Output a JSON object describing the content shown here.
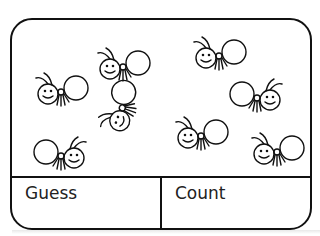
{
  "card": {
    "labels": {
      "guess": "Guess",
      "count": "Count"
    },
    "ants": [
      {
        "x": 22,
        "y": 50,
        "flip": false,
        "rot": 0
      },
      {
        "x": 84,
        "y": 25,
        "flip": false,
        "rot": 0
      },
      {
        "x": 180,
        "y": 14,
        "flip": false,
        "rot": 0
      },
      {
        "x": 214,
        "y": 56,
        "flip": true,
        "rot": 0
      },
      {
        "x": 82,
        "y": 64,
        "flip": false,
        "rot": -70
      },
      {
        "x": 162,
        "y": 94,
        "flip": false,
        "rot": 0
      },
      {
        "x": 18,
        "y": 114,
        "flip": true,
        "rot": 0
      },
      {
        "x": 238,
        "y": 110,
        "flip": false,
        "rot": 0
      }
    ],
    "ant_count": 8
  },
  "colors": {
    "ink": "#111111",
    "paper": "#ffffff"
  }
}
